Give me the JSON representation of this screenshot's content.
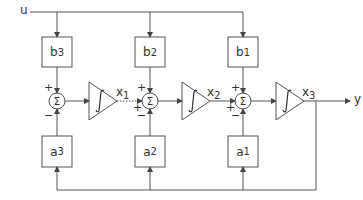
{
  "diagram": {
    "type": "block-diagram",
    "input_label": "u",
    "output_label": "y",
    "b_blocks": [
      {
        "base": "b",
        "sub": "3"
      },
      {
        "base": "b",
        "sub": "2"
      },
      {
        "base": "b",
        "sub": "1"
      }
    ],
    "a_blocks": [
      {
        "base": "a",
        "sub": "3"
      },
      {
        "base": "a",
        "sub": "2"
      },
      {
        "base": "a",
        "sub": "1"
      }
    ],
    "summers": [
      {
        "symbol": "Σ",
        "plus_top": "+",
        "minus_bottom": "−"
      },
      {
        "symbol": "Σ",
        "plus_top": "+",
        "plus_left": "+",
        "minus_bottom": "−"
      },
      {
        "symbol": "Σ",
        "plus_top": "+",
        "plus_left": "+",
        "minus_bottom": "−"
      }
    ],
    "integrators": [
      {
        "symbol": "∫",
        "output": {
          "base": "x",
          "sub": "1"
        }
      },
      {
        "symbol": "∫",
        "output": {
          "base": "x",
          "sub": "2"
        }
      },
      {
        "symbol": "∫",
        "output": {
          "base": "x",
          "sub": "3"
        }
      }
    ],
    "line_color": "#555555"
  }
}
